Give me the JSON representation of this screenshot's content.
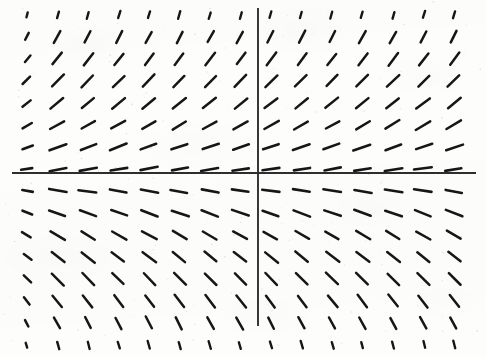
{
  "figure": {
    "kind": "slope-field",
    "caption": "",
    "background_color": "#fdfdfc",
    "ink_color": "#161616",
    "axis_color": "#2e2e2e"
  },
  "axes": {
    "x_axis": {
      "name": "horizontal-axis",
      "y_pixel": 173,
      "x_start_pixel": 12,
      "x_end_pixel": 476,
      "label": "",
      "tick_labels": []
    },
    "y_axis": {
      "name": "vertical-axis",
      "x_pixel": 258,
      "y_start_pixel": 8,
      "y_end_pixel": 326,
      "label": "",
      "tick_labels": []
    },
    "origin_pixel": [
      258,
      173
    ]
  },
  "chart_data": {
    "type": "scatter",
    "title": "",
    "subtitle": "",
    "xlabel": "",
    "ylabel": "",
    "grid": false,
    "legend": null,
    "legend_position": "none",
    "xlim": [
      -8.5,
      7.5
    ],
    "ylim": [
      -8.5,
      8.5
    ],
    "equation_implied": "dy/dx = k*y",
    "grid_columns": 15,
    "grid_rows": 16,
    "x_spacing_px": 30.5,
    "y_spacing_px": 22,
    "first_column_x_px": 27,
    "first_row_y_px": 15,
    "column_x_values": [
      -7.6,
      -6.6,
      -5.6,
      -4.6,
      -3.6,
      -2.6,
      -1.6,
      -0.6,
      0.4,
      1.4,
      2.4,
      3.4,
      4.4,
      5.4,
      6.4
    ],
    "row_y_values": [
      7.2,
      6.2,
      5.2,
      4.2,
      3.2,
      2.2,
      1.2,
      0.5,
      -0.5,
      -1.2,
      -2.2,
      -3.2,
      -4.2,
      -5.2,
      -6.2,
      -7.2
    ],
    "row_slope_angles_deg": [
      -74,
      -62,
      -52,
      -45,
      -38,
      -30,
      -20,
      -9,
      9,
      20,
      30,
      38,
      45,
      52,
      62,
      74
    ],
    "row_segment_lengths_px": [
      7,
      13,
      15,
      16,
      16,
      16,
      17,
      17,
      17,
      17,
      16,
      16,
      16,
      15,
      13,
      7
    ],
    "row_stroke_widths_px": [
      2.4,
      2.5,
      2.5,
      2.5,
      2.5,
      2.5,
      2.6,
      2.6,
      2.6,
      2.6,
      2.5,
      2.5,
      2.5,
      2.5,
      2.5,
      2.4
    ],
    "first_column_length_scale": 0.62
  }
}
